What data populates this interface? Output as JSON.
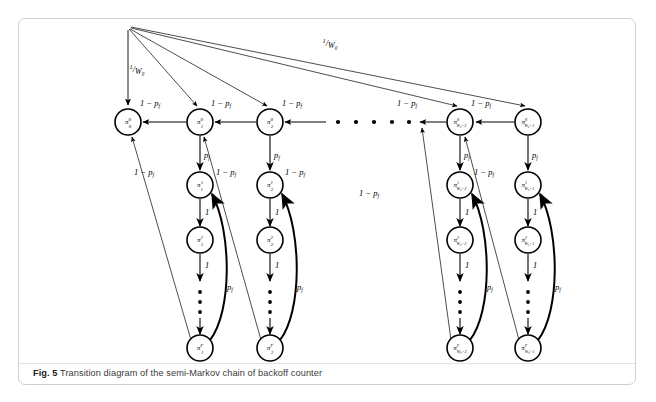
{
  "figure": {
    "caption_label": "Fig. 5",
    "caption_text": "Transition diagram of the semi-Markov chain of backoff counter",
    "border_color": "#cfcfcf",
    "ink_color": "#000000"
  },
  "diagram": {
    "type": "state-transition-diagram",
    "node_radius": 13,
    "columns": [
      {
        "id": "c0",
        "x": 128,
        "subscript": "0",
        "has_chain": false
      },
      {
        "id": "c1",
        "x": 200,
        "subscript": "1",
        "has_chain": true
      },
      {
        "id": "c2",
        "x": 270,
        "subscript": "2",
        "has_chain": true
      },
      {
        "id": "cm2",
        "x": 460,
        "subscript": "W₀−2",
        "has_chain": true
      },
      {
        "id": "cm1",
        "x": 528,
        "subscript": "W₀−1",
        "has_chain": true
      }
    ],
    "rows": [
      {
        "id": "r0",
        "y": 122,
        "superscript": "0"
      },
      {
        "id": "r1",
        "y": 185,
        "superscript": "1"
      },
      {
        "id": "r2",
        "y": 240,
        "superscript": "2"
      },
      {
        "id": "rF",
        "y": 348,
        "superscript": "F"
      }
    ],
    "nodes": [
      {
        "name": "pi-0-0",
        "col": "c0",
        "row": "r0",
        "cx": 128,
        "cy": 122,
        "pi": "π",
        "sup": "0",
        "sub": "0"
      },
      {
        "name": "pi-1-0",
        "col": "c1",
        "row": "r0",
        "cx": 200,
        "cy": 122,
        "pi": "π",
        "sup": "0",
        "sub": "1"
      },
      {
        "name": "pi-2-0",
        "col": "c2",
        "row": "r0",
        "cx": 270,
        "cy": 122,
        "pi": "π",
        "sup": "0",
        "sub": "2"
      },
      {
        "name": "pi-W0m2-0",
        "col": "cm2",
        "row": "r0",
        "cx": 460,
        "cy": 122,
        "pi": "π",
        "sup": "0",
        "sub": "W₀−2"
      },
      {
        "name": "pi-W0m1-0",
        "col": "cm1",
        "row": "r0",
        "cx": 528,
        "cy": 122,
        "pi": "π",
        "sup": "0",
        "sub": "W₀−1"
      },
      {
        "name": "pi-1-1",
        "col": "c1",
        "row": "r1",
        "cx": 200,
        "cy": 185,
        "pi": "π",
        "sup": "1",
        "sub": "1"
      },
      {
        "name": "pi-2-1",
        "col": "c2",
        "row": "r1",
        "cx": 270,
        "cy": 185,
        "pi": "π",
        "sup": "1",
        "sub": "2"
      },
      {
        "name": "pi-W0m2-1",
        "col": "cm2",
        "row": "r1",
        "cx": 460,
        "cy": 185,
        "pi": "π",
        "sup": "1",
        "sub": "W₀−2"
      },
      {
        "name": "pi-W0m1-1",
        "col": "cm1",
        "row": "r1",
        "cx": 528,
        "cy": 185,
        "pi": "π",
        "sup": "1",
        "sub": "W₀−1"
      },
      {
        "name": "pi-1-2",
        "col": "c1",
        "row": "r2",
        "cx": 200,
        "cy": 240,
        "pi": "π",
        "sup": "2",
        "sub": "1"
      },
      {
        "name": "pi-2-2",
        "col": "c2",
        "row": "r2",
        "cx": 270,
        "cy": 240,
        "pi": "π",
        "sup": "2",
        "sub": "2"
      },
      {
        "name": "pi-W0m2-2",
        "col": "cm2",
        "row": "r2",
        "cx": 460,
        "cy": 240,
        "pi": "π",
        "sup": "2",
        "sub": "W₀−2"
      },
      {
        "name": "pi-W0m1-2",
        "col": "cm1",
        "row": "r2",
        "cx": 528,
        "cy": 240,
        "pi": "π",
        "sup": "2",
        "sub": "W₀−1"
      },
      {
        "name": "pi-1-F",
        "col": "c1",
        "row": "rF",
        "cx": 200,
        "cy": 348,
        "pi": "π",
        "sup": "F",
        "sub": "1"
      },
      {
        "name": "pi-2-F",
        "col": "c2",
        "row": "rF",
        "cx": 270,
        "cy": 348,
        "pi": "π",
        "sup": "F",
        "sub": "2"
      },
      {
        "name": "pi-W0m2-F",
        "col": "cm2",
        "row": "rF",
        "cx": 460,
        "cy": 348,
        "pi": "π",
        "sup": "F",
        "sub": "W₀−2"
      },
      {
        "name": "pi-W0m1-F",
        "col": "cm1",
        "row": "rF",
        "cx": 528,
        "cy": 348,
        "pi": "π",
        "sup": "F",
        "sub": "W₀−1"
      }
    ],
    "fanout_origin": {
      "x": 128,
      "y": 28
    },
    "edge_labels": {
      "one_over_w0": "1/W₀",
      "one_minus_pf": "1 − p",
      "pf": "p",
      "one": "1",
      "pf_sub": "f"
    },
    "labels": [
      {
        "name": "label-1-over-w0-left",
        "text_num": "1",
        "text_den": "W₀",
        "x": 137,
        "y": 72
      },
      {
        "name": "label-1-over-w0-right",
        "text_num": "1",
        "text_den": "W₀",
        "x": 330,
        "y": 46
      },
      {
        "name": "label-1-minus-pf-top-1",
        "text": "1 − p",
        "sub": "f",
        "x": 150,
        "y": 106
      },
      {
        "name": "label-1-minus-pf-top-2",
        "text": "1 − p",
        "sub": "f",
        "x": 221,
        "y": 106
      },
      {
        "name": "label-1-minus-pf-top-3",
        "text": "1 − p",
        "sub": "f",
        "x": 292,
        "y": 106
      },
      {
        "name": "label-1-minus-pf-top-4",
        "text": "1 − p",
        "sub": "f",
        "x": 407,
        "y": 106
      },
      {
        "name": "label-1-minus-pf-top-5",
        "text": "1 − p",
        "sub": "f",
        "x": 481,
        "y": 106
      },
      {
        "name": "label-1-minus-pf-diag-1",
        "text": "1 − p",
        "sub": "f",
        "x": 144,
        "y": 175
      },
      {
        "name": "label-1-minus-pf-diag-2",
        "text": "1 − p",
        "sub": "f",
        "x": 226,
        "y": 175
      },
      {
        "name": "label-1-minus-pf-diag-3",
        "text": "1 − p",
        "sub": "f",
        "x": 295,
        "y": 175
      },
      {
        "name": "label-1-minus-pf-diag-4",
        "text": "1 − p",
        "sub": "f",
        "x": 369,
        "y": 196
      },
      {
        "name": "label-1-minus-pf-diag-5",
        "text": "1 − p",
        "sub": "f",
        "x": 484,
        "y": 175
      },
      {
        "name": "label-pf-col1-r0",
        "text": "p",
        "sub": "f",
        "x": 207,
        "y": 158
      },
      {
        "name": "label-pf-col2-r0",
        "text": "p",
        "sub": "f",
        "x": 277,
        "y": 158
      },
      {
        "name": "label-pf-col4-r0",
        "text": "p",
        "sub": "f",
        "x": 467,
        "y": 158
      },
      {
        "name": "label-pf-col5-r0",
        "text": "p",
        "sub": "f",
        "x": 535,
        "y": 158
      },
      {
        "name": "label-one-col1-r1",
        "text": "1",
        "x": 207,
        "y": 215
      },
      {
        "name": "label-one-col2-r1",
        "text": "1",
        "x": 277,
        "y": 215
      },
      {
        "name": "label-one-col4-r1",
        "text": "1",
        "x": 467,
        "y": 215
      },
      {
        "name": "label-one-col5-r1",
        "text": "1",
        "x": 535,
        "y": 215
      },
      {
        "name": "label-one-col1-r2",
        "text": "1",
        "x": 207,
        "y": 268
      },
      {
        "name": "label-one-col2-r2",
        "text": "1",
        "x": 277,
        "y": 268
      },
      {
        "name": "label-one-col4-r2",
        "text": "1",
        "x": 467,
        "y": 268
      },
      {
        "name": "label-one-col5-r2",
        "text": "1",
        "x": 535,
        "y": 268
      },
      {
        "name": "label-pf-return-col1",
        "text": "p",
        "sub": "f",
        "x": 230,
        "y": 290
      },
      {
        "name": "label-pf-return-col2",
        "text": "p",
        "sub": "f",
        "x": 300,
        "y": 290
      },
      {
        "name": "label-pf-return-col4",
        "text": "p",
        "sub": "f",
        "x": 490,
        "y": 290
      },
      {
        "name": "label-pf-return-col5",
        "text": "p",
        "sub": "f",
        "x": 558,
        "y": 290
      }
    ],
    "horizontal_dots": {
      "y": 122,
      "xs": [
        338,
        356,
        374,
        392,
        410
      ]
    },
    "vertical_dots_y": [
      292,
      302,
      312
    ]
  }
}
